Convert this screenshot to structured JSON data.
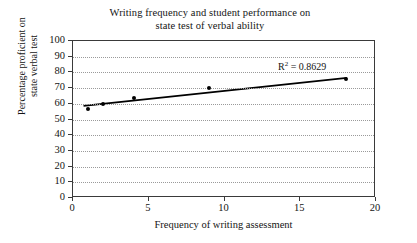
{
  "chart_data": {
    "type": "scatter",
    "title": "Writing frequency and student performance on state test of verbal ability",
    "title_lines": [
      "Writing frequency and student performance on",
      "state test of verbal ability"
    ],
    "xlabel": "Frequency of writing assessment",
    "ylabel": "Percentage proficient on state verbal test",
    "ylabel_lines": [
      "Percentage proficient on",
      "state verbal test"
    ],
    "xlim": [
      0,
      20
    ],
    "ylim": [
      0,
      100
    ],
    "xticks": [
      0,
      5,
      10,
      15,
      20
    ],
    "yticks": [
      0,
      10,
      20,
      30,
      40,
      50,
      60,
      70,
      80,
      90,
      100
    ],
    "xtick_labels": [
      "0",
      "5",
      "10",
      "15",
      "20"
    ],
    "ytick_labels": [
      "0",
      "10",
      "20",
      "30",
      "40",
      "50",
      "60",
      "70",
      "80",
      "90",
      "100"
    ],
    "grid": "horizontal-dotted",
    "legend": "none",
    "x": [
      1,
      2,
      4,
      9,
      18
    ],
    "values": [
      57,
      60,
      63.5,
      70,
      76
    ],
    "points": [
      {
        "x": 1,
        "y": 57
      },
      {
        "x": 2,
        "y": 60
      },
      {
        "x": 4,
        "y": 63.5
      },
      {
        "x": 9,
        "y": 70
      },
      {
        "x": 18,
        "y": 76
      }
    ],
    "trendline": {
      "type": "linear",
      "x_start": 0.7,
      "y_start": 58.2,
      "x_end": 18.2,
      "y_end": 76.2,
      "color": "#000000"
    },
    "annotations": [
      {
        "name": "r-squared",
        "text_prefix": "R",
        "text_superscript": "2",
        "text_suffix": " = 0.8629",
        "full_text": "R2 = 0.8629",
        "value": 0.8629,
        "x": 13.6,
        "y": 84
      }
    ],
    "colors": {
      "point": "#000000",
      "line": "#000000",
      "grid": "#9a9a9a",
      "frame": "#3a3a3a",
      "background": "#ffffff",
      "text": "#141414"
    }
  }
}
